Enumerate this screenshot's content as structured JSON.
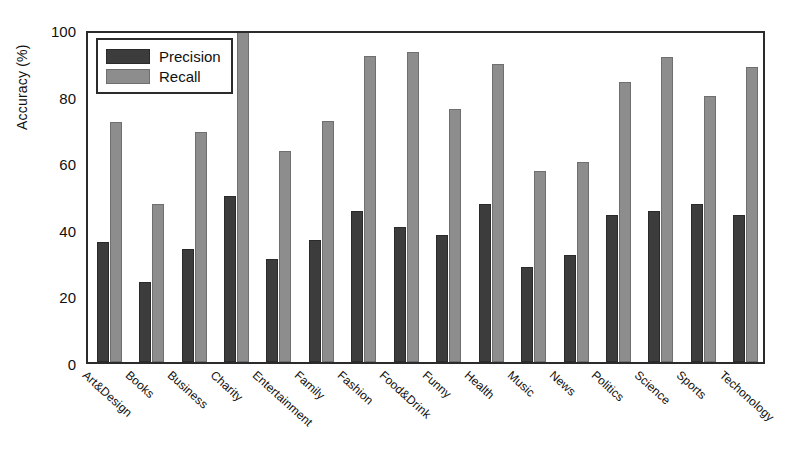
{
  "chart_data": {
    "type": "bar",
    "title": "",
    "xlabel": "",
    "ylabel": "Accuracy (%)",
    "ylim": [
      0,
      100
    ],
    "yticks": [
      0,
      20,
      40,
      60,
      80,
      100
    ],
    "grid": false,
    "legend_position": "top-left",
    "categories": [
      "Art&Design",
      "Books",
      "Business",
      "Charity",
      "Entertainment",
      "Family",
      "Fashion",
      "Food&Drink",
      "Funny",
      "Health",
      "Music",
      "News",
      "Politics",
      "Science",
      "Sports",
      "Techonology"
    ],
    "series": [
      {
        "name": "Precision",
        "color": "#3c3c3c",
        "values": [
          36,
          24,
          34,
          50,
          31,
          36.5,
          45.5,
          40.5,
          38,
          47.5,
          28.5,
          32,
          44,
          45.5,
          47.5,
          44
        ]
      },
      {
        "name": "Recall",
        "color": "#8d8d8d",
        "values": [
          72,
          47.5,
          69,
          100,
          63.5,
          72.5,
          92,
          93,
          76,
          89.5,
          57.5,
          60,
          84,
          91.5,
          80,
          88.5
        ]
      }
    ]
  },
  "axes": {
    "y_tick_labels": [
      "0",
      "20",
      "40",
      "60",
      "80",
      "100"
    ]
  },
  "legend": {
    "entries": [
      {
        "label": "Precision",
        "swatch": "precision"
      },
      {
        "label": "Recall",
        "swatch": "recall"
      }
    ]
  }
}
